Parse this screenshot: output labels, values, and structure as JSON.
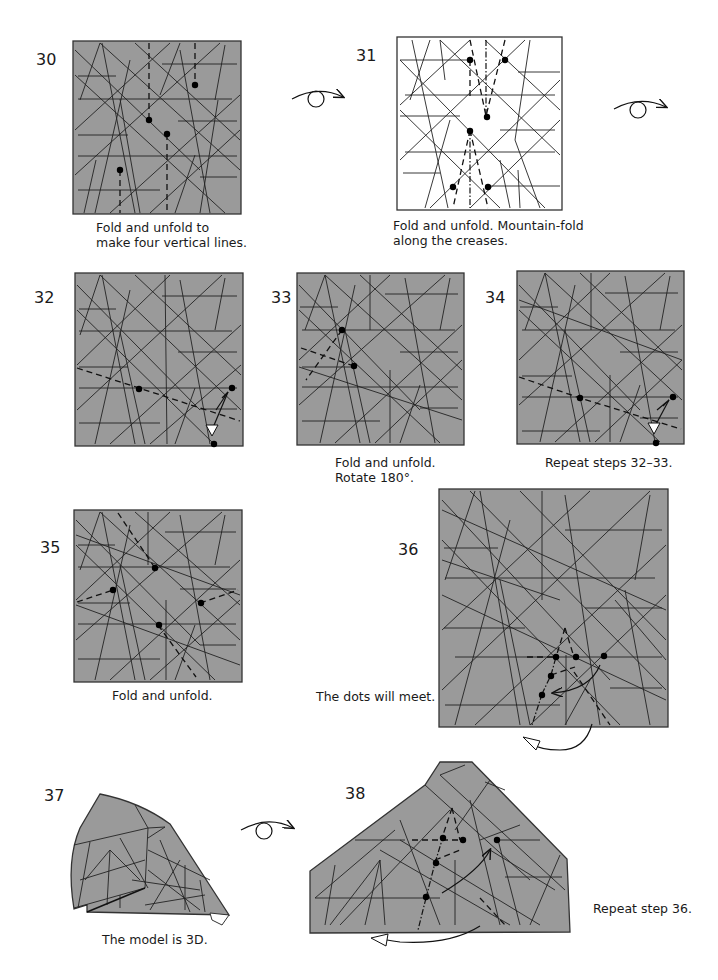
{
  "steps": [
    {
      "number": "30",
      "caption_lines": [
        "Fold and unfold to",
        "make four vertical lines."
      ]
    },
    {
      "number": "31",
      "caption_lines": [
        "Fold and unfold. Mountain-fold",
        "along the creases."
      ]
    },
    {
      "number": "32",
      "caption_lines": []
    },
    {
      "number": "33",
      "caption_lines": [
        "Fold and unfold.",
        "Rotate 180°."
      ]
    },
    {
      "number": "34",
      "caption_lines": [
        "Repeat steps 32–33."
      ]
    },
    {
      "number": "35",
      "caption_lines": [
        "Fold and unfold."
      ]
    },
    {
      "number": "36",
      "caption_lines": [
        "The dots will meet."
      ]
    },
    {
      "number": "37",
      "caption_lines": [
        "The model is 3D."
      ]
    },
    {
      "number": "38",
      "caption_lines": [
        "Repeat step 36."
      ]
    }
  ],
  "icons": {
    "turn_over": "turn-over-icon",
    "push_arrow": "hollow-arrowhead",
    "fold_arrow": "curved-arrow"
  },
  "colors": {
    "paper_gray": "#9a9a9a",
    "crease": "#222222",
    "background": "#ffffff"
  }
}
